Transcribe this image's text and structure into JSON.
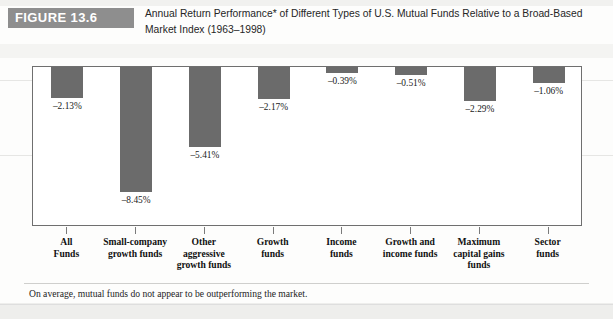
{
  "figure": {
    "tag": "FIGURE 13.6",
    "title": "Annual Return Performance* of Different Types of U.S. Mutual Funds Relative to a Broad-Based Market Index (1963–1998)",
    "footnote": "On average, mutual funds do not appear to be outperforming the market.",
    "tag_background": "#8e8e8e",
    "bar_color": "#6b6b6b"
  },
  "chart_data": {
    "type": "bar",
    "title": "Annual Return Performance* of Different Types of U.S. Mutual Funds Relative to a Broad-Based Market Index (1963–1998)",
    "xlabel": "",
    "ylabel": "",
    "ylim": [
      -9.2,
      0
    ],
    "grid": false,
    "legend": null,
    "orientation": "vertical",
    "categories": [
      "All Funds",
      "Small-company growth funds",
      "Other aggressive growth funds",
      "Growth funds",
      "Income funds",
      "Growth and income funds",
      "Maximum capital gains funds",
      "Sector funds"
    ],
    "category_lines": [
      [
        "All",
        "Funds"
      ],
      [
        "Small-company",
        "growth funds"
      ],
      [
        "Other",
        "aggressive",
        "growth funds"
      ],
      [
        "Growth",
        "funds"
      ],
      [
        "Income",
        "funds"
      ],
      [
        "Growth and",
        "income funds"
      ],
      [
        "Maximum",
        "capital gains",
        "funds"
      ],
      [
        "Sector",
        "funds"
      ]
    ],
    "values": [
      -2.13,
      -8.45,
      -5.41,
      -2.17,
      -0.39,
      -0.51,
      -2.29,
      -1.06
    ],
    "value_labels": [
      "–2.13%",
      "–8.45%",
      "–5.41%",
      "–2.17%",
      "–0.39%",
      "–0.51%",
      "–2.29%",
      "–1.06%"
    ]
  }
}
